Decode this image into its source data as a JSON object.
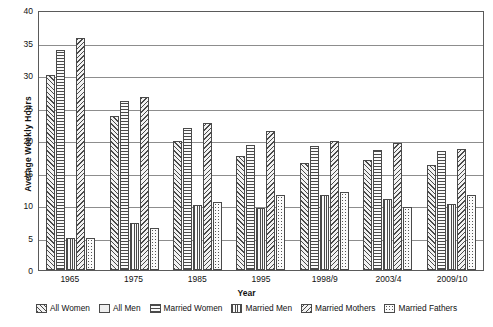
{
  "chart_data": {
    "type": "bar",
    "title": "",
    "xlabel": "Year",
    "ylabel": "Average Weekly Hours",
    "ylim": [
      0,
      40
    ],
    "yticks": [
      40,
      35,
      30,
      25,
      20,
      15,
      10,
      5,
      0
    ],
    "grid": true,
    "legend_position": "bottom",
    "categories": [
      "1965",
      "1975",
      "1985",
      "1995",
      "1998/9",
      "2003/4",
      "2009/10"
    ],
    "series": [
      {
        "name": "All Women",
        "pattern": "diagonal-hatch-up",
        "values": [
          30.0,
          23.7,
          19.8,
          17.5,
          16.5,
          17.0,
          16.2
        ]
      },
      {
        "name": "All Men",
        "pattern": "solid-light",
        "values": [
          null,
          null,
          null,
          null,
          null,
          null,
          null
        ]
      },
      {
        "name": "Married Women",
        "pattern": "horizontal-hatch",
        "values": [
          33.9,
          26.0,
          21.9,
          19.3,
          19.1,
          18.5,
          18.3
        ]
      },
      {
        "name": "Married Men",
        "pattern": "vertical-hatch",
        "values": [
          5.0,
          7.2,
          10.0,
          9.6,
          11.5,
          11.0,
          10.2
        ]
      },
      {
        "name": "Married Mothers",
        "pattern": "diagonal-hatch-down",
        "values": [
          35.7,
          26.6,
          22.6,
          21.4,
          19.9,
          19.6,
          18.6
        ]
      },
      {
        "name": "Married Fathers",
        "pattern": "dotted",
        "values": [
          4.9,
          6.5,
          10.4,
          11.6,
          12.0,
          9.7,
          11.5
        ]
      }
    ]
  },
  "legend": {
    "items": [
      {
        "label": "All Women"
      },
      {
        "label": "All Men"
      },
      {
        "label": "Married Women"
      },
      {
        "label": "Married Men"
      },
      {
        "label": "Married Mothers"
      },
      {
        "label": "Married Fathers"
      }
    ]
  }
}
